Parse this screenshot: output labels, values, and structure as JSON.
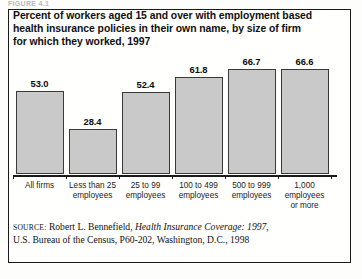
{
  "figure": {
    "caption_strip": "FIGURE 4.1",
    "title_lines": [
      "Percent of workers aged 15 and over with employment based",
      "health insurance policies in their own name, by size of firm",
      "for which they worked, 1997"
    ],
    "bar_fill_color": "#c9c9c9",
    "bar_border_color": "#3a3a3a",
    "frame_color": "#1a1a1a"
  },
  "source": {
    "label": "Source:",
    "author": " Robert L. Bennefield, ",
    "work_italic": "Health Insurance Coverage: 1997",
    "tail": ",",
    "line2": "U.S. Bureau of the Census, P60-202, Washington, D.C., 1998"
  },
  "chart_data": {
    "type": "bar",
    "title": "Percent of workers aged 15 and over with employment based health insurance policies in their own name, by size of firm for which they worked, 1997",
    "xlabel": "",
    "ylabel": "Percent",
    "ylim": [
      0,
      70
    ],
    "grid": false,
    "legend": "none",
    "categories": [
      "All firms",
      "Less than 25 employees",
      "25 to 99 employees",
      "100 to 499 employees",
      "500 to 999 employees",
      "1,000 employees or more"
    ],
    "category_label_lines": [
      [
        "All firms"
      ],
      [
        "Less than 25",
        "employees"
      ],
      [
        "25 to 99",
        "employees"
      ],
      [
        "100 to 499",
        "employees"
      ],
      [
        "500 to 999",
        "employees"
      ],
      [
        "1,000",
        "employees",
        "or more"
      ]
    ],
    "values": [
      53.0,
      28.4,
      52.4,
      61.8,
      66.7,
      66.6
    ],
    "value_labels": [
      "53.0",
      "28.4",
      "52.4",
      "61.8",
      "66.7",
      "66.6"
    ]
  }
}
